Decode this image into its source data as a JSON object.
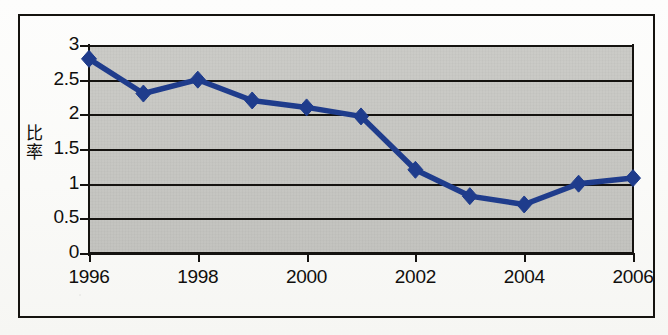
{
  "figure": {
    "kind": "scanned-line-chart",
    "border_color": "#15130f",
    "plot_bg_color": "#c7c7c3",
    "series_color": "#1f3c8c"
  },
  "axis_title": {
    "y": "比率"
  },
  "chart_data": {
    "type": "line",
    "title": "",
    "xlabel": "",
    "ylabel": "比率",
    "x": [
      1996,
      1997,
      1998,
      1999,
      2000,
      2001,
      2002,
      2003,
      2004,
      2005,
      2006
    ],
    "values": [
      2.8,
      2.3,
      2.5,
      2.2,
      2.1,
      1.97,
      1.2,
      0.82,
      0.7,
      1.0,
      1.08
    ],
    "series": [
      {
        "name": "比率",
        "color": "#1f3c8c",
        "marker": "diamond",
        "values": [
          2.8,
          2.3,
          2.5,
          2.2,
          2.1,
          1.97,
          1.2,
          0.82,
          0.7,
          1.0,
          1.08
        ]
      }
    ],
    "xlim": [
      1996,
      2006
    ],
    "ylim": [
      0,
      3
    ],
    "ytick_labels": [
      "0",
      "0.5",
      "1",
      "1.5",
      "2",
      "2.5",
      "3"
    ],
    "ytick_values": [
      0,
      0.5,
      1,
      1.5,
      2,
      2.5,
      3
    ],
    "xtick_labels": [
      "1996",
      "1998",
      "2000",
      "2002",
      "2004",
      "2006"
    ],
    "xtick_values": [
      1996,
      1998,
      2000,
      2002,
      2004,
      2006
    ],
    "grid": "horizontal",
    "legend": "none"
  }
}
